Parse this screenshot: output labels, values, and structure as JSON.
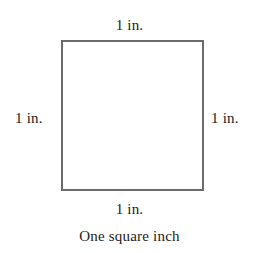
{
  "figure": {
    "caption": "One square inch",
    "shape": {
      "kind": "square",
      "border_color": "#6b6b6b",
      "fill_color": "#ffffff",
      "border_width_px": 2
    },
    "labels": {
      "top": "1 in.",
      "right": "1 in.",
      "bottom": "1 in.",
      "left": "1 in."
    },
    "background_color": "#ffffff",
    "text_color": "#1c1c1c"
  }
}
